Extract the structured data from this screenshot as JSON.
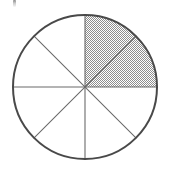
{
  "figure": {
    "kind": "fraction-circle-diagram",
    "caption": "Circle divided into eight equal sectors with two adjacent sectors shaded",
    "background_color": "#ffffff",
    "outline_color": "#4a4a4a",
    "spoke_color": "#6b6b6b",
    "shade_color": "#a8a8a8",
    "shade_pattern": "dither-checkerboard"
  },
  "circle": {
    "center_x": 85,
    "center_y": 87,
    "radius": 72,
    "outline_width": 2.0,
    "spoke_width": 1.1
  },
  "sectors": {
    "total": 8,
    "shaded_count": 2,
    "unshaded_count": 6,
    "sector_angle_degrees": 45,
    "fraction_shaded": "2/8",
    "fraction_shaded_simplified": "1/4",
    "items": [
      {
        "index": 1,
        "start_deg": 0,
        "end_deg": 45,
        "shaded": true,
        "label": "sector-1"
      },
      {
        "index": 2,
        "start_deg": 45,
        "end_deg": 90,
        "shaded": true,
        "label": "sector-2"
      },
      {
        "index": 3,
        "start_deg": 90,
        "end_deg": 135,
        "shaded": false,
        "label": "sector-3"
      },
      {
        "index": 4,
        "start_deg": 135,
        "end_deg": 180,
        "shaded": false,
        "label": "sector-4"
      },
      {
        "index": 5,
        "start_deg": 180,
        "end_deg": 225,
        "shaded": false,
        "label": "sector-5"
      },
      {
        "index": 6,
        "start_deg": 225,
        "end_deg": 270,
        "shaded": false,
        "label": "sector-6"
      },
      {
        "index": 7,
        "start_deg": 270,
        "end_deg": 315,
        "shaded": false,
        "label": "sector-7"
      },
      {
        "index": 8,
        "start_deg": 315,
        "end_deg": 360,
        "shaded": false,
        "label": "sector-8"
      }
    ]
  },
  "artifact": {
    "present": true,
    "name": "scan-artifact",
    "description": "faint clipped ink mark at top-left edge"
  }
}
